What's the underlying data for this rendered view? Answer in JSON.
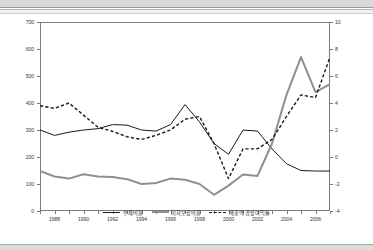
{
  "header": {
    "corner_note": "",
    "banner_name": "top-banner"
  },
  "chart_data": {
    "type": "line",
    "title": "",
    "subtitle": "",
    "xlabel": "",
    "ylabel": "",
    "y2label": "",
    "grid": false,
    "legend_position": "bottom-center",
    "x": [
      1987,
      1988,
      1989,
      1990,
      1991,
      1992,
      1993,
      1994,
      1995,
      1996,
      1997,
      1998,
      1999,
      2000,
      2001,
      2002,
      2003,
      2004,
      2005,
      2006,
      2007
    ],
    "xtick_labels": [
      "1988",
      "1990",
      "1992",
      "1994",
      "1996",
      "1998",
      "2000",
      "2002",
      "2004",
      "2006"
    ],
    "xtick_values": [
      1988,
      1990,
      1992,
      1994,
      1996,
      1998,
      2000,
      2002,
      2004,
      2006
    ],
    "xlim": [
      1987,
      2007
    ],
    "ylim": [
      0,
      700
    ],
    "ytick_labels": [
      "0",
      "100",
      "200",
      "300",
      "400",
      "500",
      "600",
      "700"
    ],
    "ytick_values": [
      0,
      100,
      200,
      300,
      400,
      500,
      600,
      700
    ],
    "y2lim": [
      -4,
      10
    ],
    "y2tick_labels": [
      "-4",
      "-2",
      "0",
      "2",
      "4",
      "6",
      "8",
      "10"
    ],
    "y2tick_values": [
      -4,
      -2,
      0,
      2,
      4,
      6,
      8,
      10
    ],
    "series": [
      {
        "name": "부채비율",
        "axis": "left",
        "style": "solid",
        "color": "#1a1a1a",
        "width": 1.0,
        "values": [
          300,
          280,
          292,
          300,
          305,
          320,
          318,
          300,
          296,
          320,
          394,
          330,
          250,
          210,
          300,
          296,
          230,
          175,
          150,
          148,
          148
        ]
      },
      {
        "name": "이자보상비율",
        "axis": "left",
        "style": "solid",
        "color": "#8f8f8f",
        "width": 2.0,
        "values": [
          148,
          128,
          120,
          136,
          128,
          126,
          118,
          100,
          104,
          120,
          116,
          100,
          60,
          94,
          135,
          130,
          250,
          430,
          570,
          440,
          470
        ]
      },
      {
        "name": "매출액 경상이익률",
        "axis": "right",
        "style": "dashed",
        "color": "#1a1a1a",
        "width": 1.4,
        "values": [
          3.8,
          3.6,
          4.0,
          3.1,
          2.2,
          1.9,
          1.5,
          1.3,
          1.6,
          2.0,
          2.8,
          3.0,
          1.0,
          -1.6,
          0.6,
          0.6,
          1.3,
          3.0,
          4.6,
          4.4,
          7.4
        ]
      }
    ]
  },
  "legend": {
    "items": [
      {
        "label": "부채비율",
        "key": "solid-black"
      },
      {
        "label": "이자보상비율",
        "key": "solid-gray"
      },
      {
        "label": "매출액 경상이익률",
        "key": "dashed-black"
      }
    ]
  }
}
